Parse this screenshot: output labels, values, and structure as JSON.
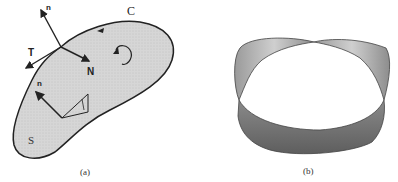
{
  "figure_a": {
    "caption": "(a)",
    "labels": {
      "curve": "C",
      "surface": "S",
      "normal_top": "n",
      "tangent": "T",
      "curve_normal": "N",
      "normal_inner": "n"
    },
    "fill_color": "#d9d9d9",
    "stroke_color": "#222222"
  },
  "figure_b": {
    "caption": "(b)",
    "description": "Möbius strip",
    "dark_color": "#6e6e6e",
    "light_color": "#bdbdbd"
  }
}
